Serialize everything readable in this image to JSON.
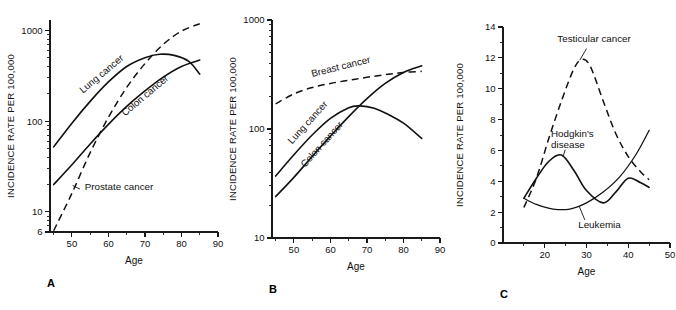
{
  "figure": {
    "panel_count": 3,
    "background": "#ffffff",
    "ink_color": "#111111"
  },
  "chart_data": [
    {
      "id": "panel-a",
      "type": "line",
      "panel_letter": "A",
      "title": "",
      "xlabel": "Age",
      "ylabel": "INCIDENCE RATE PER 100,000",
      "yscale": "log",
      "xscale": "linear",
      "xlim": [
        44,
        90
      ],
      "ylim": [
        6,
        1300
      ],
      "grid": false,
      "legend": "inline-labels",
      "xticks": [
        50,
        60,
        70,
        80,
        90
      ],
      "xtick_labels": [
        "50",
        "60",
        "70",
        "80",
        "90"
      ],
      "yticks": [
        10,
        100,
        1000
      ],
      "ytick_labels": [
        "10",
        "100",
        "1000"
      ],
      "extra_ytick_labels": [
        {
          "value": 6,
          "label": "6"
        }
      ],
      "series": [
        {
          "name": "Lung cancer",
          "style": "solid",
          "label_rotation": -40,
          "x": [
            45,
            50,
            55,
            60,
            65,
            70,
            74,
            78,
            82,
            85
          ],
          "values": [
            52,
            95,
            165,
            270,
            400,
            500,
            545,
            530,
            455,
            330
          ]
        },
        {
          "name": "Colon cancer",
          "style": "solid",
          "label_rotation": -40,
          "x": [
            45,
            50,
            55,
            60,
            65,
            70,
            75,
            80,
            85
          ],
          "values": [
            20,
            33,
            56,
            92,
            145,
            215,
            305,
            400,
            470
          ]
        },
        {
          "name": "Prostate cancer",
          "style": "dashed",
          "label_rotation": 0,
          "x": [
            45,
            50,
            55,
            60,
            65,
            70,
            75,
            80,
            85
          ],
          "values": [
            6.2,
            16,
            45,
            110,
            235,
            430,
            700,
            980,
            1180
          ]
        }
      ]
    },
    {
      "id": "panel-b",
      "type": "line",
      "panel_letter": "B",
      "title": "",
      "xlabel": "Age",
      "ylabel": "INCIDENCE RATE PER 100,000",
      "yscale": "log",
      "xscale": "linear",
      "xlim": [
        44,
        90
      ],
      "ylim": [
        10,
        1000
      ],
      "grid": false,
      "legend": "inline-labels",
      "xticks": [
        50,
        60,
        70,
        80,
        90
      ],
      "xtick_labels": [
        "50",
        "60",
        "70",
        "80",
        "90"
      ],
      "yticks": [
        10,
        100,
        1000
      ],
      "ytick_labels": [
        "10",
        "100",
        "1000"
      ],
      "extra_ytick_labels": [],
      "series": [
        {
          "name": "Breast cancer",
          "style": "dashed",
          "label_rotation": -14,
          "x": [
            45,
            50,
            55,
            60,
            65,
            70,
            75,
            80,
            85
          ],
          "values": [
            170,
            210,
            240,
            262,
            280,
            298,
            315,
            330,
            338
          ]
        },
        {
          "name": "Lung cancer",
          "style": "solid",
          "label_rotation": -48,
          "x": [
            45,
            50,
            55,
            60,
            65,
            68,
            72,
            76,
            80,
            85
          ],
          "values": [
            37,
            58,
            88,
            125,
            157,
            163,
            155,
            135,
            113,
            82
          ]
        },
        {
          "name": "Colon cancer",
          "style": "solid",
          "label_rotation": -48,
          "x": [
            45,
            50,
            55,
            60,
            65,
            70,
            75,
            80,
            85
          ],
          "values": [
            24,
            36,
            56,
            86,
            130,
            190,
            262,
            330,
            380
          ]
        }
      ]
    },
    {
      "id": "panel-c",
      "type": "line",
      "panel_letter": "C",
      "title": "",
      "xlabel": "Age",
      "ylabel": "INCIDENCE RATE PER 100,000",
      "yscale": "linear",
      "xscale": "linear",
      "xlim": [
        10,
        50
      ],
      "ylim": [
        0,
        14
      ],
      "grid": false,
      "legend": "inline-labels",
      "xticks": [
        20,
        30,
        40,
        50
      ],
      "xtick_labels": [
        "20",
        "30",
        "40",
        "50"
      ],
      "yticks": [
        0,
        2,
        4,
        6,
        8,
        10,
        12,
        14
      ],
      "ytick_labels": [
        "0",
        "2",
        "4",
        "6",
        "8",
        "10",
        "12",
        "14"
      ],
      "minor_yticks": [
        1,
        3,
        5,
        7,
        9,
        11,
        13
      ],
      "series": [
        {
          "name": "Testicular cancer",
          "style": "dashed",
          "label_rotation": 0,
          "x": [
            15,
            18,
            21,
            24,
            27,
            29,
            31,
            34,
            37,
            40,
            43,
            45
          ],
          "values": [
            2.3,
            4.2,
            6.8,
            9.2,
            11.3,
            11.9,
            11.4,
            9.2,
            7.1,
            5.6,
            4.6,
            4.1
          ]
        },
        {
          "name": "Hodgkin's disease",
          "style": "solid",
          "label_rotation": 0,
          "x": [
            15,
            18,
            21,
            24,
            27,
            30,
            34,
            37,
            40,
            43,
            45
          ],
          "values": [
            2.9,
            4.2,
            5.3,
            5.7,
            4.7,
            3.4,
            2.6,
            3.3,
            4.2,
            3.9,
            3.6
          ]
        },
        {
          "name": "Leukemia",
          "style": "thin",
          "label_rotation": 0,
          "x": [
            15,
            18,
            22,
            26,
            30,
            34,
            38,
            42,
            45
          ],
          "values": [
            2.9,
            2.5,
            2.2,
            2.2,
            2.6,
            3.3,
            4.3,
            5.8,
            7.3
          ]
        }
      ]
    }
  ]
}
